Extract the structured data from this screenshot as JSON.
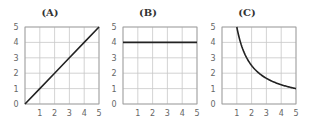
{
  "chart_data": [
    {
      "type": "line",
      "title": "(A)",
      "xlabel": "",
      "ylabel": "",
      "xlim": [
        0,
        5
      ],
      "ylim": [
        0,
        5
      ],
      "xticks": [
        "1",
        "2",
        "3",
        "4",
        "5"
      ],
      "yticks": [
        "0",
        "1",
        "2",
        "3",
        "4",
        "5"
      ],
      "grid": true,
      "series": [
        {
          "name": "y = x",
          "x": [
            0,
            1,
            2,
            3,
            4,
            5
          ],
          "y": [
            0,
            1,
            2,
            3,
            4,
            5
          ]
        }
      ]
    },
    {
      "type": "line",
      "title": "(B)",
      "xlabel": "",
      "ylabel": "",
      "xlim": [
        0,
        5
      ],
      "ylim": [
        0,
        5
      ],
      "xticks": [
        "1",
        "2",
        "3",
        "4",
        "5"
      ],
      "yticks": [
        "0",
        "1",
        "2",
        "3",
        "4",
        "5"
      ],
      "grid": true,
      "series": [
        {
          "name": "y = 4",
          "x": [
            0,
            1,
            2,
            3,
            4,
            5
          ],
          "y": [
            4,
            4,
            4,
            4,
            4,
            4
          ]
        }
      ]
    },
    {
      "type": "line",
      "title": "(C)",
      "xlabel": "",
      "ylabel": "",
      "xlim": [
        0,
        5
      ],
      "ylim": [
        0,
        5
      ],
      "xticks": [
        "1",
        "2",
        "3",
        "4",
        "5"
      ],
      "yticks": [
        "0",
        "1",
        "2",
        "3",
        "4",
        "5"
      ],
      "grid": true,
      "series": [
        {
          "name": "y = 5/x",
          "x": [
            1,
            1.25,
            1.5,
            2,
            2.5,
            3,
            3.5,
            4,
            4.5,
            5
          ],
          "y": [
            5,
            4,
            3.33,
            2.5,
            2,
            1.67,
            1.43,
            1.25,
            1.11,
            1
          ]
        }
      ]
    }
  ],
  "style": {
    "line_color": "#222222",
    "grid_color": "#c8c8c8",
    "axis_color": "#999999"
  }
}
